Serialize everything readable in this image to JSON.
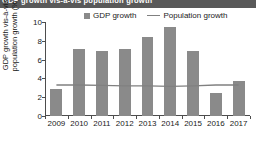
{
  "banner": {
    "text": "GDP growth vis-a-vis population growth"
  },
  "chart_data": {
    "type": "bar",
    "title": "",
    "xlabel": "",
    "ylabel": "GDP growth vis-à-vis population growth (%)",
    "ylabel_line1": "GDP growth vis-à-vis",
    "ylabel_line2": "population growth (%)",
    "categories": [
      "2009",
      "2010",
      "2011",
      "2012",
      "2013",
      "2014",
      "2015",
      "2016",
      "2017"
    ],
    "values": [
      2.9,
      7.1,
      6.9,
      7.1,
      8.45,
      9.45,
      6.9,
      2.4,
      3.7
    ],
    "ylim": [
      0,
      10
    ],
    "yticks": [
      0,
      2,
      4,
      6,
      8,
      10
    ],
    "ytick_labels": [
      "0",
      "2",
      "4",
      "6",
      "8",
      "10"
    ],
    "grid": false,
    "legend_position": "top",
    "series": [
      {
        "name": "GDP growth",
        "type": "bar",
        "color": "#8a8a8a",
        "values": [
          2.9,
          7.1,
          6.9,
          7.1,
          8.45,
          9.45,
          6.9,
          2.4,
          3.7
        ]
      },
      {
        "name": "Population growth",
        "type": "line",
        "color": "#808080",
        "values": [
          3.3,
          3.3,
          3.25,
          3.2,
          3.2,
          3.15,
          3.2,
          3.3,
          3.3
        ]
      }
    ]
  },
  "legend": {
    "entries": [
      {
        "label": "GDP growth",
        "marker": "square-swatch-icon",
        "color": "#8a8a8a"
      },
      {
        "label": "Population growth",
        "marker": "line-swatch-icon",
        "color": "#808080"
      }
    ]
  }
}
